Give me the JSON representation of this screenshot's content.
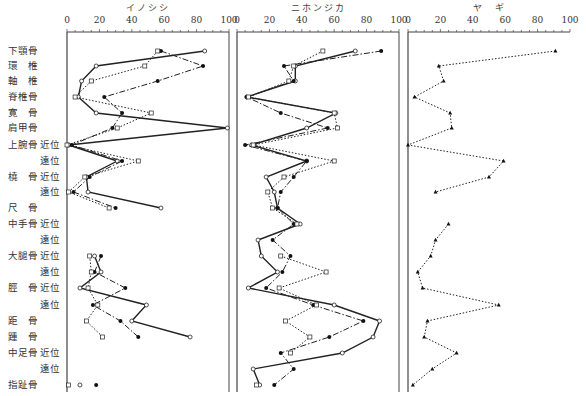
{
  "chart_data": {
    "type": "line",
    "orientation": "horizontal-profile",
    "xlim": [
      0,
      100
    ],
    "xticks": [
      0,
      20,
      40,
      60,
      80,
      100
    ],
    "grid": false,
    "rows": [
      {
        "bone": "下顎骨",
        "pos": ""
      },
      {
        "bone": "環　椎",
        "pos": ""
      },
      {
        "bone": "軸　椎",
        "pos": ""
      },
      {
        "bone": "脊椎骨",
        "pos": ""
      },
      {
        "bone": "寛　骨",
        "pos": ""
      },
      {
        "bone": "肩甲骨",
        "pos": ""
      },
      {
        "bone": "上腕骨",
        "pos": "近位"
      },
      {
        "bone": "",
        "pos": "遠位"
      },
      {
        "bone": "橈　骨",
        "pos": "近位"
      },
      {
        "bone": "",
        "pos": "遠位"
      },
      {
        "bone": "尺　骨",
        "pos": ""
      },
      {
        "bone": "中手骨",
        "pos": "近位"
      },
      {
        "bone": "",
        "pos": "遠位"
      },
      {
        "bone": "大腿骨",
        "pos": "近位"
      },
      {
        "bone": "",
        "pos": "遠位"
      },
      {
        "bone": "脛　骨",
        "pos": "近位"
      },
      {
        "bone": "",
        "pos": "遠位"
      },
      {
        "bone": "距　骨",
        "pos": ""
      },
      {
        "bone": "踵　骨",
        "pos": ""
      },
      {
        "bone": "中足骨",
        "pos": "近位"
      },
      {
        "bone": "",
        "pos": "遠位"
      },
      {
        "bone": "指趾骨",
        "pos": ""
      }
    ],
    "row_y": [
      51,
      66,
      81,
      97,
      113,
      128,
      145,
      161,
      177,
      192,
      208,
      224,
      240,
      256,
      272,
      288,
      305,
      321,
      337,
      353,
      369,
      385
    ],
    "panels": [
      {
        "title": "イノシシ",
        "x0": 67,
        "x100": 229,
        "series": [
          {
            "name": "series-solid-open-circle",
            "style": "solid",
            "marker": "circle-open",
            "values": [
              85,
              18,
              9,
              7,
              18,
              99,
              1,
              31,
              12,
              13,
              58,
              null,
              null,
              17,
              21,
              8,
              49,
              40,
              76,
              null,
              null,
              8
            ]
          },
          {
            "name": "series-dashdot-filled-circle",
            "style": "dashdot",
            "marker": "circle-filled",
            "values": [
              58,
              84,
              56,
              23,
              34,
              28,
              3,
              34,
              14,
              4,
              30,
              null,
              null,
              21,
              17,
              36,
              16,
              33,
              44,
              null,
              null,
              18
            ]
          },
          {
            "name": "series-dotted-open-square",
            "style": "dotted",
            "marker": "square-open",
            "values": [
              56,
              48,
              15,
              5,
              52,
              31,
              0,
              44,
              11,
              1,
              26,
              null,
              null,
              14,
              15,
              13,
              19,
              12,
              22,
              null,
              null,
              1
            ]
          }
        ]
      },
      {
        "title": "ニホンジカ",
        "x0": 237,
        "x100": 399,
        "series": [
          {
            "name": "series-solid-open-circle",
            "style": "solid",
            "marker": "circle-open",
            "values": [
              73,
              36,
              36,
              6,
              61,
              43,
              9,
              43,
              18,
              23,
              25,
              39,
              13,
              15,
              25,
              7,
              60,
              88,
              84,
              65,
              10,
              14
            ]
          },
          {
            "name": "series-dashdot-filled-circle",
            "style": "dashdot",
            "marker": "circle-filled",
            "values": [
              89,
              29,
              35,
              6,
              27,
              56,
              5,
              43,
              35,
              27,
              25,
              35,
              22,
              33,
              28,
              18,
              47,
              78,
              57,
              27,
              35,
              23
            ]
          },
          {
            "name": "series-dotted-open-square",
            "style": "dotted",
            "marker": "square-open",
            "values": [
              53,
              35,
              32,
              7,
              60,
              62,
              10,
              60,
              29,
              19,
              22,
              37,
              null,
              27,
              55,
              26,
              49,
              30,
              45,
              33,
              null,
              12
            ]
          }
        ]
      },
      {
        "title": "ヤ　ギ",
        "x0": 408,
        "x100": 570,
        "series": [
          {
            "name": "series-dotted-filled-triangle",
            "style": "dotted",
            "marker": "triangle-filled",
            "values": [
              91,
              19,
              22,
              4,
              26,
              27,
              0,
              59,
              50,
              17,
              null,
              25,
              17,
              14,
              6,
              9,
              56,
              12,
              10,
              30,
              15,
              3
            ]
          }
        ]
      }
    ]
  }
}
